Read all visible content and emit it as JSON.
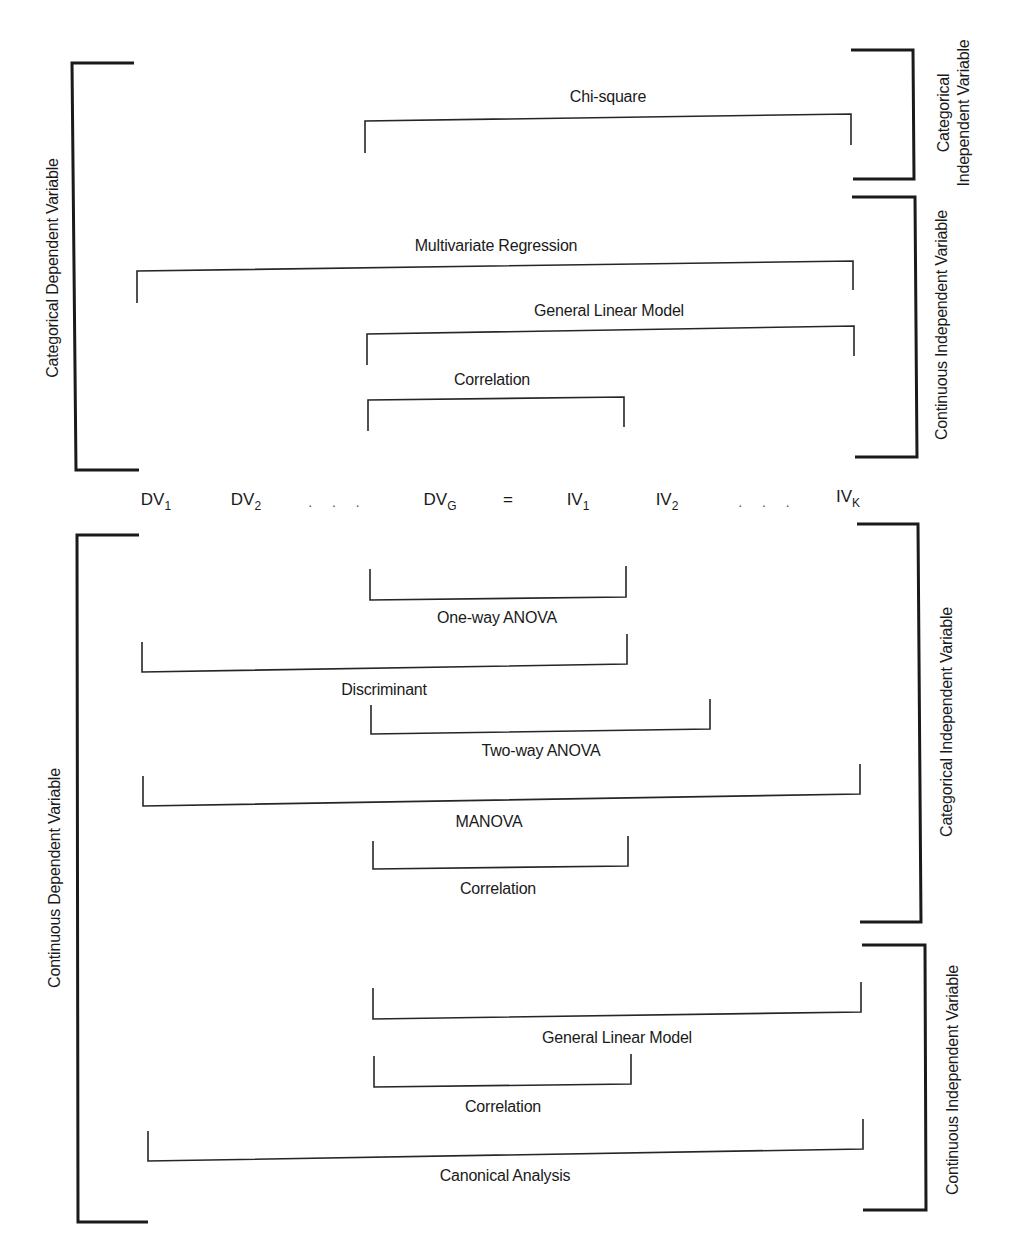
{
  "diagram": {
    "equation": {
      "terms": [
        {
          "base": "DV",
          "sub": "1"
        },
        {
          "base": "DV",
          "sub": "2"
        },
        {
          "base": "DV",
          "sub": "G"
        },
        {
          "base": "IV",
          "sub": "1"
        },
        {
          "base": "IV",
          "sub": "2"
        },
        {
          "base": "IV",
          "sub": "K"
        }
      ],
      "ellipsis": ". . .",
      "equals": "="
    },
    "axis_labels": {
      "left_top": "Categorical Dependent Variable",
      "left_bottom": "Continuous Dependent Variable",
      "right_top_1_line1": "Categorical",
      "right_top_1_line2": "Independent Variable",
      "right_top_2": "Continuous Independent Variable",
      "right_bottom_1": "Categorical Independent Variable",
      "right_bottom_2": "Continuous Independent Variable"
    },
    "top_methods": [
      {
        "label": "Chi-square"
      },
      {
        "label": "Multivariate Regression"
      },
      {
        "label": "General Linear Model"
      },
      {
        "label": "Correlation"
      }
    ],
    "bottom_methods": [
      {
        "label": "One-way ANOVA"
      },
      {
        "label": "Discriminant"
      },
      {
        "label": "Two-way ANOVA"
      },
      {
        "label": "MANOVA"
      },
      {
        "label": "Correlation"
      },
      {
        "label": "General Linear Model"
      },
      {
        "label": "Correlation"
      },
      {
        "label": "Canonical Analysis"
      }
    ]
  }
}
